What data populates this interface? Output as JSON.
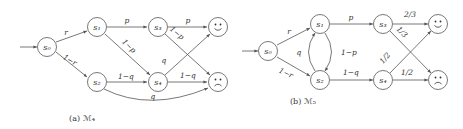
{
  "diagrams": [
    {
      "id": "m4",
      "caption": "(a) ℳ₄",
      "nodes": {
        "s0": "s₀",
        "s1": "s₁",
        "s2": "s₂",
        "s3": "s₃",
        "s4": "s₄",
        "happy": "happy-terminal",
        "sad": "sad-terminal"
      },
      "edges": [
        {
          "from": "s0",
          "to": "s1",
          "label": "r"
        },
        {
          "from": "s0",
          "to": "s2",
          "label": "1−r"
        },
        {
          "from": "s1",
          "to": "s3",
          "label": "p"
        },
        {
          "from": "s1",
          "to": "s4",
          "label": "1−p"
        },
        {
          "from": "s2",
          "to": "s4",
          "label": "1−q"
        },
        {
          "from": "s2",
          "to": "sad",
          "label": "q"
        },
        {
          "from": "s3",
          "to": "happy",
          "label": "p"
        },
        {
          "from": "s3",
          "to": "sad",
          "label": "1−p"
        },
        {
          "from": "s4",
          "to": "happy",
          "label": "q"
        },
        {
          "from": "s4",
          "to": "sad",
          "label": "1−q"
        }
      ]
    },
    {
      "id": "m5",
      "caption": "(b) ℳ₅",
      "nodes": {
        "s0": "s₀",
        "s1": "s₁",
        "s2": "s₂",
        "s3": "s₃",
        "s4": "s₄",
        "happy": "happy-terminal",
        "sad": "sad-terminal"
      },
      "edges": [
        {
          "from": "s0",
          "to": "s1",
          "label": "r"
        },
        {
          "from": "s0",
          "to": "s2",
          "label": "1−r"
        },
        {
          "from": "s1",
          "to": "s3",
          "label": "p"
        },
        {
          "from": "s1",
          "to": "s2",
          "label": "1−p"
        },
        {
          "from": "s2",
          "to": "s1",
          "label": "q"
        },
        {
          "from": "s2",
          "to": "s4",
          "label": "1−q"
        },
        {
          "from": "s3",
          "to": "happy",
          "label": "2/3"
        },
        {
          "from": "s3",
          "to": "sad",
          "label": "1/3"
        },
        {
          "from": "s4",
          "to": "happy",
          "label": "1/2"
        },
        {
          "from": "s4",
          "to": "sad",
          "label": "1/2"
        }
      ]
    }
  ]
}
